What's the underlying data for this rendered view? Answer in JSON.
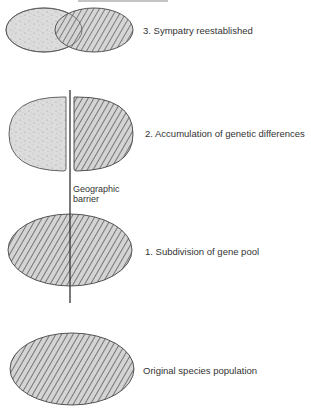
{
  "diagram": {
    "title_partial": "",
    "stages": [
      {
        "id": "stage-3",
        "number": "3.",
        "label": "3.  Sympatry reestablished"
      },
      {
        "id": "stage-2",
        "number": "2.",
        "label": "2.  Accumulation of genetic differences"
      },
      {
        "id": "stage-1",
        "number": "1.",
        "label": "1.  Subdivision of gene pool"
      },
      {
        "id": "stage-0",
        "number": "",
        "label": "Original species population"
      }
    ],
    "barrier": {
      "line1": "Geographic",
      "line2": "barrier"
    },
    "colors": {
      "outline": "#4a4a4a",
      "stipple_fill": "#d9d9d9",
      "hatch_fill": "#cfcfcf",
      "hatch_line": "#555555",
      "background": "#ffffff"
    }
  }
}
